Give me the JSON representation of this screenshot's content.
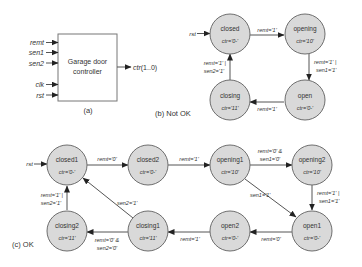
{
  "part_a": {
    "box_label_line1": "Garage door",
    "box_label_line2": "controller",
    "inputs": [
      "remt",
      "sen1",
      "sen2",
      "clk",
      "rst"
    ],
    "output_name": "ctr",
    "output_range": "(1..0)",
    "caption": "(a)"
  },
  "part_b": {
    "caption": "(b) Not OK",
    "reset_label": "rst",
    "states": [
      {
        "name": "closed",
        "output": "ctr='0-'"
      },
      {
        "name": "opening",
        "output": "ctr='10'"
      },
      {
        "name": "open",
        "output": "ctr='0-'"
      },
      {
        "name": "closing",
        "output": "ctr='11'"
      }
    ],
    "transitions": [
      {
        "from": "closed",
        "to": "opening",
        "label1": "remt='1'",
        "label2": ""
      },
      {
        "from": "opening",
        "to": "open",
        "label1": "remt='1' |",
        "label2": "sen1='1'"
      },
      {
        "from": "open",
        "to": "closing",
        "label1": "remt='1'",
        "label2": ""
      },
      {
        "from": "closing",
        "to": "closed",
        "label1": "remt='1' |",
        "label2": "sen2='1'"
      }
    ]
  },
  "part_c": {
    "caption": "(c) OK",
    "reset_label": "rst",
    "states": [
      {
        "name": "closed1",
        "output": "ctr='0-'"
      },
      {
        "name": "closed2",
        "output": "ctr='0-'"
      },
      {
        "name": "opening1",
        "output": "ctr='10'"
      },
      {
        "name": "opening2",
        "output": "ctr='10'"
      },
      {
        "name": "open1",
        "output": "ctr='0-'"
      },
      {
        "name": "open2",
        "output": "ctr='0-'"
      },
      {
        "name": "closing1",
        "output": "ctr='11'"
      },
      {
        "name": "closing2",
        "output": "ctr='11'"
      }
    ],
    "transitions": [
      {
        "from": "closed1",
        "to": "closed2",
        "label1": "remt='0'",
        "label2": ""
      },
      {
        "from": "closed2",
        "to": "opening1",
        "label1": "remt='1'",
        "label2": ""
      },
      {
        "from": "opening1",
        "to": "opening2",
        "label1": "remt='0' &",
        "label2": "sen1='0'"
      },
      {
        "from": "opening1",
        "to": "open1",
        "label1": "sen1='1'",
        "label2": ""
      },
      {
        "from": "opening2",
        "to": "open1",
        "label1": "remt='1' |",
        "label2": "sen1='1'"
      },
      {
        "from": "open1",
        "to": "open2",
        "label1": "remt='0'",
        "label2": ""
      },
      {
        "from": "open2",
        "to": "closing1",
        "label1": "remt='1'",
        "label2": ""
      },
      {
        "from": "closing1",
        "to": "closing2",
        "label1": "remt='0' &",
        "label2": "sen2='0'"
      },
      {
        "from": "closing1",
        "to": "closed1",
        "label1": "sen2='1'",
        "label2": ""
      },
      {
        "from": "closing2",
        "to": "closed1",
        "label1": "remt='1' |",
        "label2": "sen2='1'"
      }
    ]
  },
  "colors": {
    "state_fill": "#d9d9d9",
    "state_stroke": "#6e6e6e",
    "line": "#555555",
    "text": "#333333"
  }
}
